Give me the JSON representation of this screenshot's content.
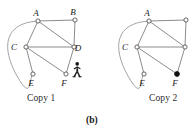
{
  "figure": {
    "panel_label": "(b)",
    "background_color": "#ffffff",
    "edge_color": "#8c8c8c",
    "arc_color": "#9a9a9a",
    "node_stroke_color": "#555555",
    "node_fill_unvisited": "#ffffff",
    "node_fill_visited": "#111111",
    "label_color": "#1a1a1a",
    "walker_color": "#161616"
  },
  "copies": [
    {
      "id": "copy-1",
      "caption": "Copy 1",
      "origin_x": 0,
      "walker": {
        "present": true,
        "at_vertex": "F",
        "x": 72,
        "y": 62
      },
      "vertices": [
        {
          "id": "A",
          "label": "A",
          "x": 38,
          "y": 21,
          "label_dx": -2,
          "label_dy": -5,
          "state": "unvisited"
        },
        {
          "id": "B",
          "label": "B",
          "x": 75,
          "y": 20,
          "label_dx": -2,
          "label_dy": -5,
          "state": "unvisited"
        },
        {
          "id": "C",
          "label": "C",
          "x": 26,
          "y": 47,
          "label_dx": -12,
          "label_dy": 3,
          "state": "unvisited"
        },
        {
          "id": "D",
          "label": "D",
          "x": 74,
          "y": 47,
          "label_dx": 4,
          "label_dy": 4,
          "state": "unvisited"
        },
        {
          "id": "E",
          "label": "E",
          "x": 33,
          "y": 74,
          "label_dx": -2,
          "label_dy": 12,
          "state": "unvisited"
        },
        {
          "id": "F",
          "label": "F",
          "x": 66,
          "y": 74,
          "label_dx": -2,
          "label_dy": 12,
          "state": "unvisited"
        }
      ],
      "edges": [
        {
          "from": "A",
          "to": "B",
          "kind": "straight"
        },
        {
          "from": "A",
          "to": "C",
          "kind": "straight"
        },
        {
          "from": "A",
          "to": "D",
          "kind": "straight"
        },
        {
          "from": "B",
          "to": "D",
          "kind": "straight"
        },
        {
          "from": "C",
          "to": "D",
          "kind": "straight"
        },
        {
          "from": "C",
          "to": "E",
          "kind": "straight"
        },
        {
          "from": "C",
          "to": "F",
          "kind": "straight"
        },
        {
          "from": "D",
          "to": "F",
          "kind": "straight"
        },
        {
          "from": "A",
          "to": "E",
          "kind": "arc",
          "sweep": "left"
        }
      ]
    },
    {
      "id": "copy-2",
      "caption": "Copy 2",
      "origin_x": 111,
      "walker": {
        "present": false,
        "at_vertex": null,
        "x": 0,
        "y": 0
      },
      "vertices": [
        {
          "id": "A",
          "label": "A",
          "x": 38,
          "y": 21,
          "label_dx": -2,
          "label_dy": -5,
          "state": "unvisited"
        },
        {
          "id": "B",
          "label": "",
          "x": 75,
          "y": 20,
          "label_dx": -2,
          "label_dy": -5,
          "state": "unvisited"
        },
        {
          "id": "C",
          "label": "C",
          "x": 26,
          "y": 47,
          "label_dx": -12,
          "label_dy": 3,
          "state": "unvisited"
        },
        {
          "id": "D",
          "label": "",
          "x": 74,
          "y": 47,
          "label_dx": 4,
          "label_dy": 4,
          "state": "unvisited"
        },
        {
          "id": "E",
          "label": "E",
          "x": 33,
          "y": 74,
          "label_dx": -2,
          "label_dy": 12,
          "state": "unvisited"
        },
        {
          "id": "F",
          "label": "F",
          "x": 66,
          "y": 74,
          "label_dx": -2,
          "label_dy": 12,
          "state": "visited"
        }
      ],
      "edges": [
        {
          "from": "A",
          "to": "B",
          "kind": "straight"
        },
        {
          "from": "A",
          "to": "C",
          "kind": "straight"
        },
        {
          "from": "A",
          "to": "D",
          "kind": "straight"
        },
        {
          "from": "B",
          "to": "D",
          "kind": "straight"
        },
        {
          "from": "C",
          "to": "D",
          "kind": "straight"
        },
        {
          "from": "C",
          "to": "E",
          "kind": "straight"
        },
        {
          "from": "C",
          "to": "F",
          "kind": "straight"
        },
        {
          "from": "D",
          "to": "F",
          "kind": "straight"
        },
        {
          "from": "A",
          "to": "E",
          "kind": "arc",
          "sweep": "left"
        }
      ]
    }
  ]
}
